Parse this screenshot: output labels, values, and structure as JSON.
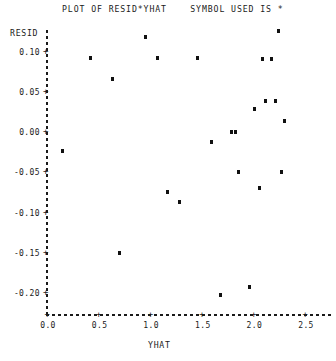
{
  "title": "PLOT OF RESID*YHAT    SYMBOL USED IS *",
  "axis_titles": {
    "y": "RESID",
    "x": "YHAT"
  },
  "chart_data": {
    "type": "scatter",
    "title": "PLOT OF RESID*YHAT    SYMBOL USED IS *",
    "xlabel": "YHAT",
    "ylabel": "RESID",
    "xlim": [
      0.0,
      2.77
    ],
    "ylim": [
      -0.213,
      0.125
    ],
    "grid": false,
    "legend": null,
    "symbol": "*",
    "xticks": [
      0.0,
      0.5,
      1.0,
      1.5,
      2.0,
      2.5
    ],
    "xtick_labels": [
      "0.0",
      "0.5",
      "1.0",
      "1.5",
      "2.0",
      "2.5"
    ],
    "yticks": [
      0.1,
      0.05,
      0.0,
      -0.05,
      -0.1,
      -0.15,
      -0.2
    ],
    "ytick_labels": [
      "0.10",
      "0.05",
      "0.00",
      "-0.05",
      "-0.10",
      "-0.15",
      "-0.20"
    ],
    "points": [
      {
        "x": 0.15,
        "y": -0.024
      },
      {
        "x": 0.42,
        "y": 0.092
      },
      {
        "x": 0.63,
        "y": 0.066
      },
      {
        "x": 0.7,
        "y": -0.15
      },
      {
        "x": 0.95,
        "y": 0.118
      },
      {
        "x": 1.07,
        "y": 0.092
      },
      {
        "x": 1.17,
        "y": -0.074
      },
      {
        "x": 1.28,
        "y": -0.087
      },
      {
        "x": 1.46,
        "y": 0.092
      },
      {
        "x": 1.59,
        "y": -0.012
      },
      {
        "x": 1.68,
        "y": -0.203
      },
      {
        "x": 1.79,
        "y": 0.0
      },
      {
        "x": 1.83,
        "y": 0.0
      },
      {
        "x": 1.86,
        "y": -0.05
      },
      {
        "x": 1.96,
        "y": -0.193
      },
      {
        "x": 2.01,
        "y": 0.029
      },
      {
        "x": 2.06,
        "y": -0.07
      },
      {
        "x": 2.09,
        "y": 0.091
      },
      {
        "x": 2.12,
        "y": 0.039
      },
      {
        "x": 2.18,
        "y": 0.091
      },
      {
        "x": 2.21,
        "y": 0.039
      },
      {
        "x": 2.24,
        "y": 0.125
      },
      {
        "x": 2.27,
        "y": -0.05
      },
      {
        "x": 2.3,
        "y": 0.014
      }
    ]
  }
}
